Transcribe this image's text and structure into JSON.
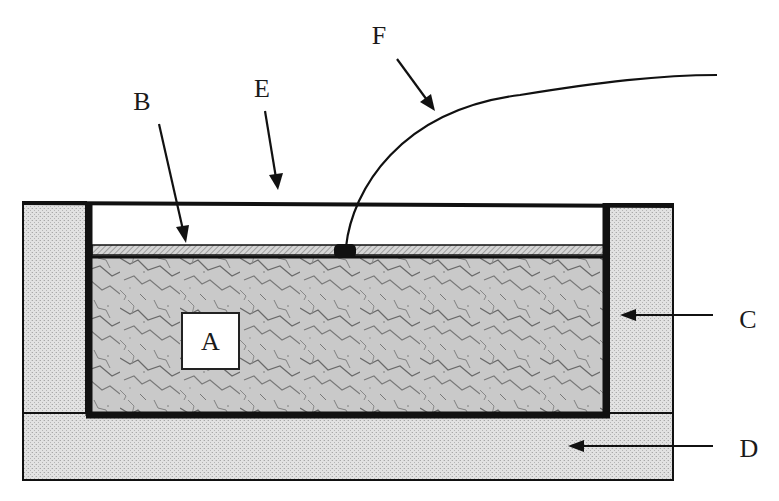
{
  "diagram": {
    "type": "cross-section schematic",
    "labels": {
      "A": "A",
      "B": "B",
      "C": "C",
      "D": "D",
      "E": "E",
      "F": "F"
    },
    "components": [
      {
        "id": "A",
        "description": "textured fill region (boxed label)"
      },
      {
        "id": "B",
        "description": "thin hatched layer atop region A"
      },
      {
        "id": "C",
        "description": "side walls / pillars"
      },
      {
        "id": "D",
        "description": "base slab"
      },
      {
        "id": "E",
        "description": "open gap / top cover line"
      },
      {
        "id": "F",
        "description": "curved lead wire attached to layer B"
      }
    ],
    "colors": {
      "line": "#111111",
      "stipple": "#d4d4d4",
      "hatch": "#b8b8b8",
      "texture": "#9a9a9a",
      "background": "#ffffff"
    }
  }
}
